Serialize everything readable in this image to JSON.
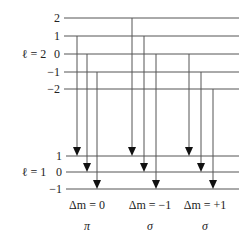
{
  "diagram": {
    "colors": {
      "line": "#555555",
      "arrow": "#111111",
      "text": "#222222"
    },
    "upper": {
      "label": "ℓ = 2",
      "label_pos": [
        34,
        58
      ],
      "line_x1": 64,
      "line_x2": 239,
      "levels": [
        {
          "m": "2",
          "y": 18
        },
        {
          "m": "1",
          "y": 36
        },
        {
          "m": "0",
          "y": 54
        },
        {
          "m": "−1",
          "y": 72
        },
        {
          "m": "−2",
          "y": 89
        }
      ]
    },
    "lower": {
      "label": "ℓ = 1",
      "label_pos": [
        34,
        176
      ],
      "line_x1": 66,
      "line_x2": 239,
      "levels": [
        {
          "m": "1",
          "y": 156
        },
        {
          "m": "0",
          "y": 172
        },
        {
          "m": "−1",
          "y": 189
        }
      ]
    },
    "transitions": [
      {
        "x": 77,
        "from_y": 36,
        "to_y": 156
      },
      {
        "x": 87,
        "from_y": 54,
        "to_y": 172
      },
      {
        "x": 97,
        "from_y": 72,
        "to_y": 189
      },
      {
        "x": 132,
        "from_y": 18,
        "to_y": 156
      },
      {
        "x": 144,
        "from_y": 36,
        "to_y": 172
      },
      {
        "x": 156,
        "from_y": 54,
        "to_y": 189
      },
      {
        "x": 189,
        "from_y": 54,
        "to_y": 156
      },
      {
        "x": 201,
        "from_y": 72,
        "to_y": 172
      },
      {
        "x": 213,
        "from_y": 89,
        "to_y": 189
      }
    ],
    "groups": [
      {
        "delta": "Δm = 0",
        "polarization": "π",
        "cx": 87
      },
      {
        "delta": "Δm = −1",
        "polarization": "σ",
        "cx": 150
      },
      {
        "delta": "Δm = +1",
        "polarization": "σ",
        "cx": 205
      }
    ],
    "group_label_y": 209,
    "polarization_y": 230
  }
}
